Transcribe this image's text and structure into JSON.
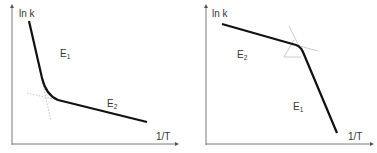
{
  "diagram": {
    "panels": [
      {
        "id": "left",
        "y_axis_label": "ln k",
        "x_axis_label": "1/T",
        "segments": [
          {
            "label": "E",
            "subscript": "1",
            "description": "steep segment (high temperature)"
          },
          {
            "label": "E",
            "subscript": "2",
            "description": "shallow segment (low temperature)"
          }
        ],
        "note": "concave-up curve with dotted tangent extrapolations at the bend"
      },
      {
        "id": "right",
        "y_axis_label": "ln k",
        "x_axis_label": "1/T",
        "segments": [
          {
            "label": "E",
            "subscript": "2",
            "description": "shallow segment (high temperature)"
          },
          {
            "label": "E",
            "subscript": "1",
            "description": "steep segment (low temperature)"
          }
        ],
        "note": "concave-down curve with thin gray tangent lines at the bend"
      }
    ],
    "colors": {
      "curve": "#111111",
      "axis": "#555555",
      "guide": "#b5b5b5",
      "text": "#333333"
    }
  }
}
